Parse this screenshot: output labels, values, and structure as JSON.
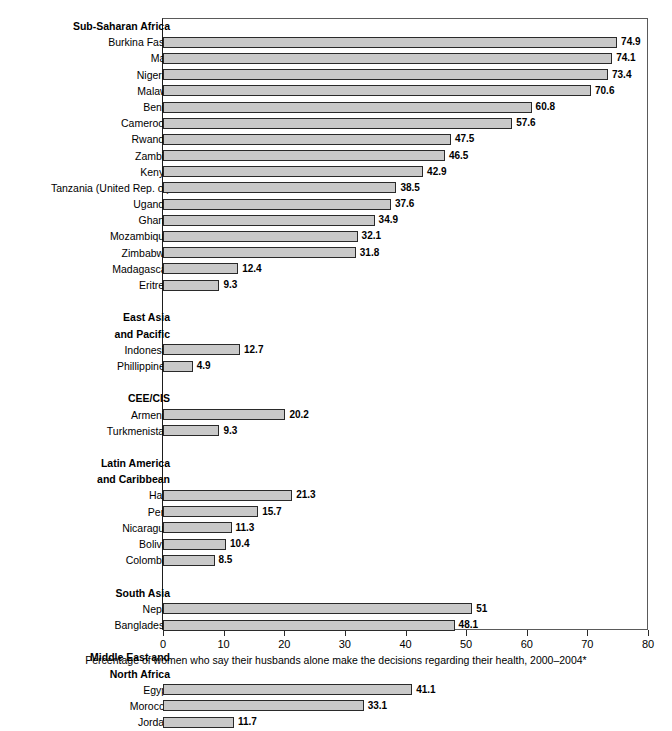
{
  "chart_data": {
    "type": "bar",
    "orientation": "horizontal",
    "title": "",
    "xlabel": "Percentage of women who say their husbands alone make the decisions regarding their health, 2000–2004*",
    "ylabel": "",
    "xlim": [
      0,
      80
    ],
    "xticks": [
      0,
      10,
      20,
      30,
      40,
      50,
      60,
      70,
      80
    ],
    "xtick_labels": [
      "0",
      "10",
      "20",
      "30",
      "40",
      "50",
      "60",
      "70",
      "80"
    ],
    "grid": false,
    "legend": "none",
    "bar_color": "#c9c9c9",
    "bar_border_color": "#2a2a2a",
    "groups": [
      {
        "name": "Sub-Saharan Africa",
        "categories": [
          "Burkina Faso",
          "Mali",
          "Nigeria",
          "Malawi",
          "Benin",
          "Cameroon",
          "Rwanda",
          "Zambia",
          "Kenya",
          "Tanzania (United Rep. of)",
          "Uganda",
          "Ghana",
          "Mozambique",
          "Zimbabwe",
          "Madagascar",
          "Eritrea"
        ],
        "values": [
          74.9,
          74.1,
          73.4,
          70.6,
          60.8,
          57.6,
          47.5,
          46.5,
          42.9,
          38.5,
          37.6,
          34.9,
          32.1,
          31.8,
          12.4,
          9.3
        ],
        "value_labels": [
          "74.9",
          "74.1",
          "73.4",
          "70.6",
          "60.8",
          "57.6",
          "47.5",
          "46.5",
          "42.9",
          "38.5",
          "37.6",
          "34.9",
          "32.1",
          "31.8",
          "12.4",
          "9.3"
        ]
      },
      {
        "name": "East Asia\nand Pacific",
        "name_lines": [
          "East Asia",
          "and Pacific"
        ],
        "categories": [
          "Indonesia",
          "Phillippines"
        ],
        "values": [
          12.7,
          4.9
        ],
        "value_labels": [
          "12.7",
          "4.9"
        ]
      },
      {
        "name": "CEE/CIS",
        "name_lines": [
          "CEE/CIS"
        ],
        "categories": [
          "Armenia",
          "Turkmenistan"
        ],
        "values": [
          20.2,
          9.3
        ],
        "value_labels": [
          "20.2",
          "9.3"
        ]
      },
      {
        "name": "Latin America\nand Caribbean",
        "name_lines": [
          "Latin America",
          "and Caribbean"
        ],
        "categories": [
          "Haiti",
          "Peru",
          "Nicaragua",
          "Bolivia",
          "Colombia"
        ],
        "values": [
          21.3,
          15.7,
          11.3,
          10.4,
          8.5
        ],
        "value_labels": [
          "21.3",
          "15.7",
          "11.3",
          "10.4",
          "8.5"
        ]
      },
      {
        "name": "South Asia",
        "name_lines": [
          "South Asia"
        ],
        "categories": [
          "Nepal",
          "Bangladesh"
        ],
        "values": [
          51,
          48.1
        ],
        "value_labels": [
          "51",
          "48.1"
        ]
      },
      {
        "name": "Middle East and\nNorth Africa",
        "name_lines": [
          "Middle East and",
          "North Africa"
        ],
        "categories": [
          "Egypt",
          "Morocco",
          "Jordan"
        ],
        "values": [
          41.1,
          33.1,
          11.7
        ],
        "value_labels": [
          "41.1",
          "33.1",
          "11.7"
        ]
      }
    ]
  },
  "caption": "Percentage of women who say their husbands alone make the decisions regarding their health, 2000–2004*"
}
